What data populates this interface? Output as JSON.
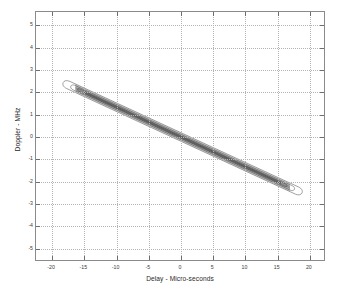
{
  "chart_data": {
    "type": "line",
    "title": "",
    "subtitle": "",
    "xlabel": "Delay - Micro-seconds",
    "ylabel": "Doppler - MHz",
    "xlim": [
      -22.5,
      22.5
    ],
    "ylim": [
      -5.6,
      5.6
    ],
    "xticks": [
      -20,
      -15,
      -10,
      -5,
      0,
      5,
      10,
      15,
      20
    ],
    "xtick_labels": [
      "-20",
      "-15",
      "-10",
      "-5",
      "0",
      "5",
      "10",
      "15",
      "20"
    ],
    "yticks": [
      -5,
      -4,
      -3,
      -2,
      -1,
      0,
      1,
      2,
      3,
      4,
      5
    ],
    "ytick_labels": [
      "-5",
      "-4",
      "-3",
      "-2",
      "-1",
      "0",
      "1",
      "2",
      "3",
      "4",
      "5"
    ],
    "grid": true,
    "grid_style": "dotted",
    "legend": "none",
    "annotations": [],
    "ridge": {
      "slope_mhz_per_us": -0.1333,
      "intercept_mhz": 0.0,
      "x_start": -17.5,
      "x_end": 18.0,
      "y_start": 2.33,
      "y_end": -2.4
    },
    "series": [
      {
        "name": "contour-outer",
        "half_width_mhz": 0.175,
        "color": "#555555",
        "values": [
          {
            "x": -17.5,
            "y": 2.333
          },
          {
            "x": -15.0,
            "y": 2.0
          },
          {
            "x": -12.5,
            "y": 1.667
          },
          {
            "x": -10.0,
            "y": 1.333
          },
          {
            "x": -7.5,
            "y": 1.0
          },
          {
            "x": -5.0,
            "y": 0.667
          },
          {
            "x": -2.5,
            "y": 0.333
          },
          {
            "x": 0.0,
            "y": 0.0
          },
          {
            "x": 2.5,
            "y": -0.333
          },
          {
            "x": 5.0,
            "y": -0.667
          },
          {
            "x": 7.5,
            "y": -1.0
          },
          {
            "x": 10.0,
            "y": -1.333
          },
          {
            "x": 12.5,
            "y": -1.667
          },
          {
            "x": 15.0,
            "y": -2.0
          },
          {
            "x": 18.0,
            "y": -2.4
          }
        ]
      },
      {
        "name": "contour-mid",
        "half_width_mhz": 0.11,
        "color": "#4a4a4a",
        "values": [
          {
            "x": -16.6,
            "y": 2.213
          },
          {
            "x": -8.3,
            "y": 1.107
          },
          {
            "x": 0.0,
            "y": 0.0
          },
          {
            "x": 8.3,
            "y": -1.107
          },
          {
            "x": 17.1,
            "y": -2.28
          }
        ]
      },
      {
        "name": "contour-inner",
        "half_width_mhz": 0.055,
        "color": "#3a3a3a",
        "values": [
          {
            "x": -15.8,
            "y": 2.107
          },
          {
            "x": 0.0,
            "y": 0.0
          },
          {
            "x": 16.2,
            "y": -2.16
          }
        ]
      },
      {
        "name": "contour-core",
        "half_width_mhz": 0.02,
        "color": "#2a2a2a",
        "values": [
          {
            "x": -15.0,
            "y": 2.0
          },
          {
            "x": 0.0,
            "y": 0.0
          },
          {
            "x": 15.4,
            "y": -2.053
          }
        ]
      }
    ]
  },
  "colors": {
    "background": "#ffffff",
    "axis": "#8a8a8a",
    "grid": "#b4b4b4",
    "text": "#2a2a2a",
    "contour": "#3a3a3a"
  }
}
